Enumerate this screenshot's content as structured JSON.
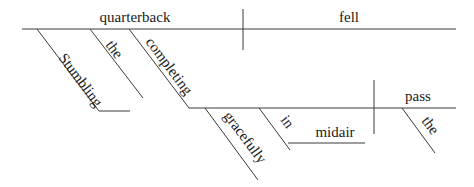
{
  "diagram_type": "Reed-Kellogg sentence diagram",
  "sentence_words": {
    "subject": "quarterback",
    "predicate": "fell",
    "subject_modifiers": {
      "participle_adjective": "Stumbling",
      "article": "the",
      "participle": "completing"
    },
    "participle_phrase": {
      "adverb": "gracefully",
      "preposition": "in",
      "prepositional_object": "midair",
      "direct_object": "pass",
      "object_article": "the"
    }
  },
  "colors": {
    "line": "#3a3a3a",
    "text": "#1a1a1a",
    "background": "#ffffff"
  }
}
